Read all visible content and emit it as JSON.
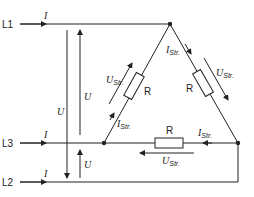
{
  "lines": {
    "l1": "L1",
    "l2": "L2",
    "l3": "L3"
  },
  "symbols": {
    "line_current": "I",
    "line_voltage": "U",
    "phase_current_main": "I",
    "phase_voltage_main": "U",
    "phase_sub": "Str.",
    "resistor": "R"
  },
  "colors": {
    "stroke": "#222222",
    "background": "#ffffff"
  }
}
